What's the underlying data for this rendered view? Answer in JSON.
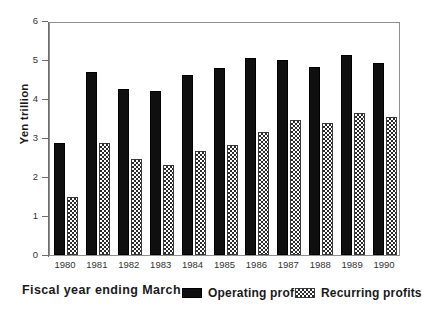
{
  "chart_data": {
    "type": "bar",
    "title": "",
    "xlabel": "Fiscal year ending March",
    "ylabel": "Yen trillion",
    "ylim": [
      0,
      6
    ],
    "yticks": [
      0,
      1,
      2,
      3,
      4,
      5,
      6
    ],
    "ytick_labels": [
      "0",
      "1",
      "2",
      "3",
      "4",
      "5",
      "6"
    ],
    "grid": false,
    "legend_position": "below-axes-right",
    "categories": [
      "1980",
      "1981",
      "1982",
      "1983",
      "1984",
      "1985",
      "1986",
      "1987",
      "1988",
      "1989",
      "1990"
    ],
    "series": [
      {
        "name": "Operating profits",
        "pattern": "solid-black",
        "color": "#100f10",
        "values": [
          2.88,
          4.69,
          4.26,
          4.2,
          4.61,
          4.79,
          5.06,
          4.99,
          4.83,
          5.13,
          4.93
        ]
      },
      {
        "name": "Recurring profits",
        "pattern": "cross-hatch",
        "color": "#2b2b2b",
        "values": [
          1.48,
          2.88,
          2.45,
          2.32,
          2.67,
          2.83,
          3.16,
          3.46,
          3.38,
          3.63,
          3.55
        ]
      }
    ]
  },
  "legend": {
    "entries": [
      {
        "label": "Operating profits",
        "swatch": "solid-black-swatch"
      },
      {
        "label": "Recurring profits",
        "swatch": "cross-hatch-swatch"
      }
    ]
  }
}
